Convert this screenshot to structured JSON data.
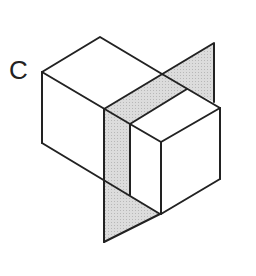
{
  "figure": {
    "label": "C",
    "colors": {
      "stroke": "#222222",
      "plane_fill": "#d4d4d4",
      "background": "#ffffff"
    }
  }
}
